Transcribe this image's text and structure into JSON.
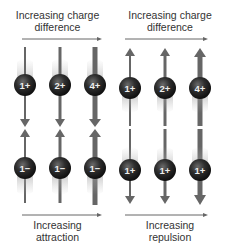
{
  "left_panel": {
    "top_label_line1": "Increasing charge",
    "top_label_line2": "difference",
    "bottom_label_line1": "Increasing",
    "bottom_label_line2": "attraction",
    "top_charges": [
      "1+",
      "2+",
      "4+"
    ],
    "bottom_charges": [
      "1−",
      "1−",
      "1−"
    ],
    "force_direction": "toward each other"
  },
  "right_panel": {
    "top_label_line1": "Increasing charge",
    "top_label_line2": "difference",
    "bottom_label_line1": "Increasing",
    "bottom_label_line2": "repulsion",
    "top_charges": [
      "1+",
      "2+",
      "4+"
    ],
    "bottom_charges": [
      "1+",
      "1+",
      "1+"
    ],
    "force_direction": "away from each other"
  },
  "colors": {
    "arrow": "#666666",
    "sphere": "#2b2b2b",
    "text": "#333333"
  }
}
